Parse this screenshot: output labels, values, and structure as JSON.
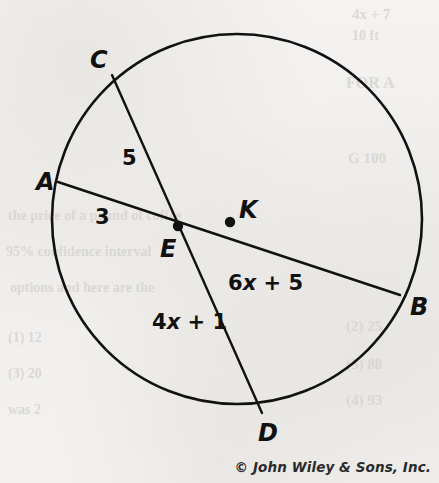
{
  "figure": {
    "background_color": "#f2f2f0",
    "ink_color": "#111111",
    "circle": {
      "label": "K",
      "center_x": 237,
      "center_y": 219,
      "radius": 185
    },
    "points": [
      {
        "id": "A",
        "label": "A",
        "x": 58,
        "y": 182,
        "label_x": 36,
        "label_y": 190,
        "on_circle": true,
        "dot": false
      },
      {
        "id": "B",
        "label": "B",
        "x": 400,
        "y": 295,
        "label_x": 410,
        "label_y": 315,
        "on_circle": true,
        "dot": false
      },
      {
        "id": "C",
        "label": "C",
        "x": 112,
        "y": 75,
        "label_x": 90,
        "label_y": 68,
        "on_circle": true,
        "dot": false
      },
      {
        "id": "D",
        "label": "D",
        "x": 262,
        "y": 413,
        "label_x": 258,
        "label_y": 441,
        "on_circle": true,
        "dot": false
      },
      {
        "id": "E",
        "label": "E",
        "x": 178,
        "y": 226,
        "label_x": 160,
        "label_y": 257,
        "on_circle": false,
        "dot": true
      },
      {
        "id": "K",
        "label": "K",
        "x": 230,
        "y": 222,
        "label_x": 239,
        "label_y": 218,
        "on_circle": false,
        "dot": true
      }
    ],
    "chords": [
      {
        "id": "AB",
        "from": "A",
        "to": "B"
      },
      {
        "id": "CD",
        "from": "C",
        "to": "D"
      }
    ],
    "segment_labels": [
      {
        "id": "CE",
        "text": "5",
        "x": 122,
        "y": 165,
        "italic_char": ""
      },
      {
        "id": "AE",
        "text": "3",
        "x": 95,
        "y": 224,
        "italic_char": ""
      },
      {
        "id": "EB",
        "text": "6x + 5",
        "x": 228,
        "y": 290,
        "italic_char": "x"
      },
      {
        "id": "ED",
        "text": "4x + 1",
        "x": 152,
        "y": 329,
        "italic_char": "x"
      }
    ]
  },
  "attribution": {
    "text": "© John Wiley & Sons, Inc."
  },
  "bleed_through": [
    {
      "text": "4x + 7",
      "x": 352,
      "y": 6,
      "size": 15,
      "rotate": 0
    },
    {
      "text": "10 ft",
      "x": 352,
      "y": 28,
      "size": 14,
      "rotate": 0
    },
    {
      "text": "FOR A",
      "x": 346,
      "y": 74,
      "size": 16,
      "rotate": 0
    },
    {
      "text": "G 100",
      "x": 348,
      "y": 150,
      "size": 15,
      "rotate": 0
    },
    {
      "text": "the price of a pound of coffee",
      "x": 8,
      "y": 208,
      "size": 14,
      "rotate": 0
    },
    {
      "text": "95% confidence interval",
      "x": 6,
      "y": 244,
      "size": 14,
      "rotate": 0
    },
    {
      "text": "options and here are the",
      "x": 10,
      "y": 280,
      "size": 14,
      "rotate": 0
    },
    {
      "text": "(2) 25",
      "x": 346,
      "y": 318,
      "size": 15,
      "rotate": 0
    },
    {
      "text": "(3) 88",
      "x": 346,
      "y": 356,
      "size": 15,
      "rotate": 0
    },
    {
      "text": "(4) 93",
      "x": 346,
      "y": 392,
      "size": 15,
      "rotate": 0
    },
    {
      "text": "(1) 12",
      "x": 8,
      "y": 330,
      "size": 14,
      "rotate": 0
    },
    {
      "text": "(3) 20",
      "x": 8,
      "y": 366,
      "size": 14,
      "rotate": 0
    },
    {
      "text": "was 2",
      "x": 8,
      "y": 402,
      "size": 14,
      "rotate": 0
    }
  ]
}
